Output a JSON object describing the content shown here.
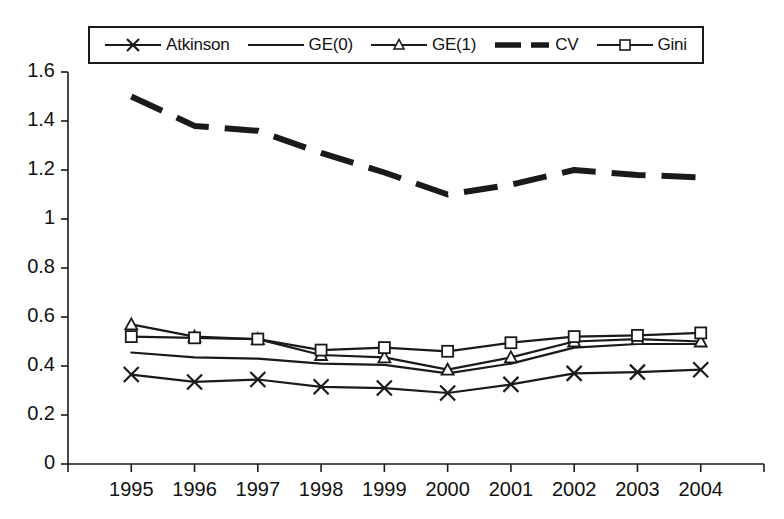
{
  "chart_data": {
    "type": "line",
    "title": "",
    "subtitle": "",
    "xlabel": "",
    "ylabel": "",
    "categories": [
      "1995",
      "1996",
      "1997",
      "1998",
      "1999",
      "2000",
      "2001",
      "2002",
      "2003",
      "2004"
    ],
    "x": [
      1995,
      1996,
      1997,
      1998,
      1999,
      2000,
      2001,
      2002,
      2003,
      2004
    ],
    "ylim": [
      0,
      1.6
    ],
    "ytick_values": [
      0,
      0.2,
      0.4,
      0.6,
      0.8,
      1,
      1.2,
      1.4,
      1.6
    ],
    "ytick_labels": [
      "0",
      "0.2",
      "0.4",
      "0.6",
      "0.8",
      "1",
      "1.2",
      "1.4",
      "1.6"
    ],
    "xtick_labels": [
      "1995",
      "1996",
      "1997",
      "1998",
      "1999",
      "2000",
      "2001",
      "2002",
      "2003",
      "2004"
    ],
    "grid": false,
    "legend_position": "top",
    "series": [
      {
        "name": "Atkinson",
        "marker": "x",
        "linestyle": "solid",
        "color": "#1a1a1a",
        "values": [
          0.365,
          0.335,
          0.345,
          0.315,
          0.31,
          0.29,
          0.325,
          0.37,
          0.375,
          0.385
        ]
      },
      {
        "name": "GE(0)",
        "marker": "none",
        "linestyle": "solid",
        "color": "#1a1a1a",
        "values": [
          0.455,
          0.435,
          0.43,
          0.41,
          0.405,
          0.37,
          0.41,
          0.475,
          0.49,
          0.49
        ]
      },
      {
        "name": "GE(1)",
        "marker": "triangle",
        "linestyle": "solid",
        "color": "#1a1a1a",
        "values": [
          0.57,
          0.52,
          0.51,
          0.445,
          0.435,
          0.385,
          0.435,
          0.5,
          0.51,
          0.5
        ]
      },
      {
        "name": "CV",
        "marker": "none",
        "linestyle": "dashed",
        "color": "#1a1a1a",
        "values": [
          1.5,
          1.38,
          1.36,
          1.27,
          1.19,
          1.1,
          1.14,
          1.2,
          1.18,
          1.17
        ]
      },
      {
        "name": "Gini",
        "marker": "square",
        "linestyle": "solid",
        "color": "#1a1a1a",
        "values": [
          0.52,
          0.515,
          0.51,
          0.465,
          0.475,
          0.46,
          0.495,
          0.52,
          0.525,
          0.535
        ]
      }
    ]
  },
  "legend": {
    "entries": [
      {
        "label": "Atkinson",
        "marker": "x-marker-icon"
      },
      {
        "label": "GE(0)",
        "marker": "plain-line-icon"
      },
      {
        "label": "GE(1)",
        "marker": "triangle-marker-icon"
      },
      {
        "label": "CV",
        "marker": "dashed-line-icon"
      },
      {
        "label": "Gini",
        "marker": "square-marker-icon"
      }
    ]
  },
  "axes": {
    "y_labels": [
      "1.6",
      "1.4",
      "1.2",
      "1",
      "0.8",
      "0.6",
      "0.4",
      "0.2",
      "0"
    ],
    "x_labels": [
      "1995",
      "1996",
      "1997",
      "1998",
      "1999",
      "2000",
      "2001",
      "2002",
      "2003",
      "2004"
    ]
  },
  "colors": {
    "ink": "#1a1a1a",
    "background": "#ffffff"
  }
}
